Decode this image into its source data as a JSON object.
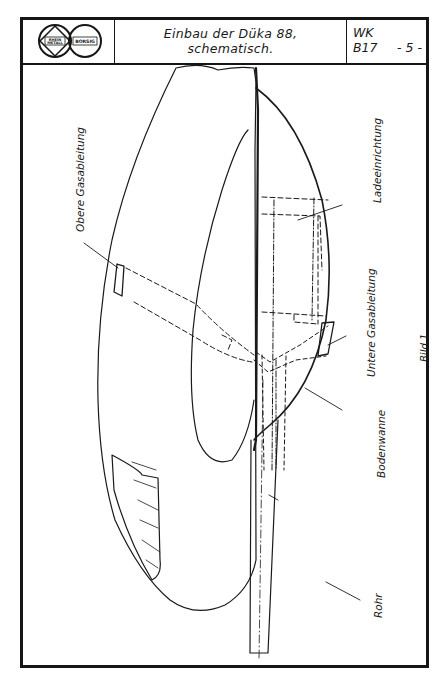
{
  "title_block": {
    "logo": {
      "left_emblem_text_top": "RHEIN",
      "left_emblem_text_bottom": "METALL",
      "right_emblem_text": "BORSIG"
    },
    "title_line_1": "Einbau der Düka 88,",
    "title_line_2": "schematisch.",
    "code_line_1": "WK",
    "code_line_2": "B17",
    "page_number": "- 5 -"
  },
  "drawing": {
    "labels": {
      "obere_gasableitung": "Obere Gasableitung",
      "ladeeinrichtung": "Ladeeinrichtung",
      "untere_gasableitung": "Untere Gasableitung",
      "bodenwanne": "Bodenwanne",
      "rohr": "Rohr"
    },
    "figure_caption": "Bild 1."
  },
  "colors": {
    "ink": "#161616",
    "paper": "#ffffff"
  }
}
